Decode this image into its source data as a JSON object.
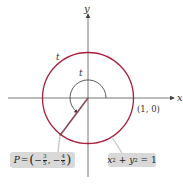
{
  "diagram": {
    "axis_labels": {
      "x": "x",
      "y": "y"
    },
    "arc_labels": {
      "outer": "t",
      "inner": "t"
    },
    "point_label": "(1, 0)",
    "point_P": {
      "name": "P",
      "eq": "=",
      "x_sign": "−",
      "x_num": "3",
      "x_den": "5",
      "sep": ",",
      "y_sign": "−",
      "y_num": "4",
      "y_den": "5"
    },
    "circle_equation": {
      "x": "x",
      "plus": " + ",
      "y": "y",
      "exp": "2",
      "rhs": " = 1"
    },
    "colors": {
      "circle": "#a8203a",
      "axis": "#555555",
      "radius": "#8a4a52",
      "label_box": "#d9d9d9",
      "highlight_axis": "#b9b9b9"
    }
  }
}
